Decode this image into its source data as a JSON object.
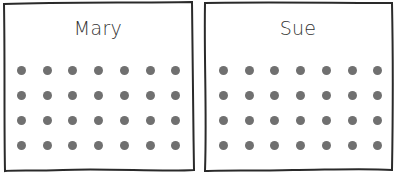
{
  "panels": [
    {
      "name": "Mary",
      "rows": 4,
      "cols": 7,
      "dot_color": "#707070"
    },
    {
      "name": "Sue",
      "rows": 4,
      "cols": 7,
      "dot_color": "#707070"
    }
  ]
}
